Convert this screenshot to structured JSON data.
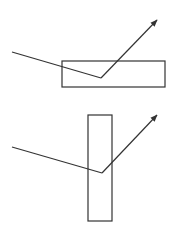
{
  "diagram": {
    "stroke_color": "#333333",
    "background": "#ffffff",
    "panels": [
      {
        "name": "horizontal-block",
        "rect": {
          "x": 62,
          "y": 61,
          "w": 103,
          "h": 26
        },
        "ray_in": {
          "x1": 12,
          "y1": 52,
          "x2": 101,
          "y2": 78
        },
        "ray_out": {
          "x1": 101,
          "y1": 78,
          "x2": 157,
          "y2": 20
        }
      },
      {
        "name": "vertical-block",
        "rect": {
          "x": 88,
          "y": 115,
          "w": 24,
          "h": 106
        },
        "ray_in": {
          "x1": 12,
          "y1": 147,
          "x2": 102,
          "y2": 173
        },
        "ray_out": {
          "x1": 102,
          "y1": 173,
          "x2": 157,
          "y2": 115
        }
      }
    ]
  }
}
